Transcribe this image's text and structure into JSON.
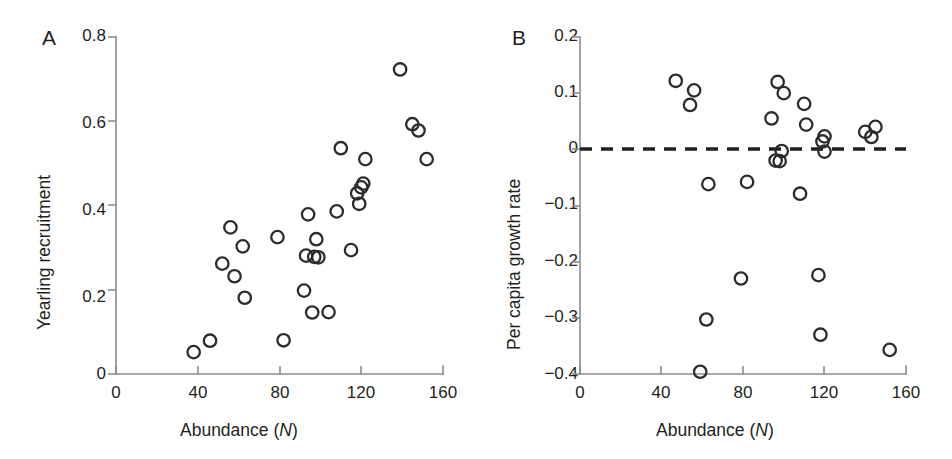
{
  "figure": {
    "background": "#ffffff",
    "marker_color": "#2b2b2b",
    "axis_color": "#8c8c8c",
    "text_color": "#231f20"
  },
  "panels": [
    {
      "label": "A",
      "xlabel_main": "Abundance (",
      "xlabel_italic": "N",
      "xlabel_tail": ")",
      "ylabel": "Yearling recruitment",
      "x_ticks": [
        "0",
        "40",
        "80",
        "120",
        "160"
      ],
      "y_ticks": [
        "0.8",
        "0.6",
        "0.4",
        "0.2",
        "0"
      ]
    },
    {
      "label": "B",
      "xlabel_main": "Abundance (",
      "xlabel_italic": "N",
      "xlabel_tail": ")",
      "ylabel": "Per capita growth rate",
      "x_ticks": [
        "0",
        "40",
        "80",
        "120",
        "160"
      ],
      "y_ticks": [
        "0.2",
        "0.1",
        "0",
        "−0.1",
        "−0.2",
        "−0.3",
        "−0.4"
      ]
    }
  ],
  "chart_data": [
    {
      "type": "scatter",
      "panel": "A",
      "title": "",
      "xlabel": "Abundance (N)",
      "ylabel": "Yearling recruitment",
      "xlim": [
        0,
        160
      ],
      "ylim": [
        0,
        0.8
      ],
      "xticks": [
        0,
        40,
        80,
        120,
        160
      ],
      "yticks": [
        0,
        0.2,
        0.4,
        0.6,
        0.8
      ],
      "grid": false,
      "legend": "none",
      "marker": "open-circle",
      "points": [
        {
          "x": 38,
          "y": 0.052
        },
        {
          "x": 46,
          "y": 0.079
        },
        {
          "x": 52,
          "y": 0.262
        },
        {
          "x": 56,
          "y": 0.348
        },
        {
          "x": 58,
          "y": 0.232
        },
        {
          "x": 62,
          "y": 0.303
        },
        {
          "x": 63,
          "y": 0.181
        },
        {
          "x": 79,
          "y": 0.325
        },
        {
          "x": 82,
          "y": 0.08
        },
        {
          "x": 92,
          "y": 0.198
        },
        {
          "x": 93,
          "y": 0.281
        },
        {
          "x": 94,
          "y": 0.379
        },
        {
          "x": 96,
          "y": 0.146
        },
        {
          "x": 97,
          "y": 0.278
        },
        {
          "x": 98,
          "y": 0.32
        },
        {
          "x": 99,
          "y": 0.277
        },
        {
          "x": 104,
          "y": 0.147
        },
        {
          "x": 108,
          "y": 0.386
        },
        {
          "x": 110,
          "y": 0.536
        },
        {
          "x": 115,
          "y": 0.294
        },
        {
          "x": 118,
          "y": 0.429
        },
        {
          "x": 119,
          "y": 0.404
        },
        {
          "x": 120,
          "y": 0.443
        },
        {
          "x": 121,
          "y": 0.452
        },
        {
          "x": 122,
          "y": 0.51
        },
        {
          "x": 139,
          "y": 0.723
        },
        {
          "x": 145,
          "y": 0.593
        },
        {
          "x": 148,
          "y": 0.578
        },
        {
          "x": 152,
          "y": 0.51
        }
      ]
    },
    {
      "type": "scatter",
      "panel": "B",
      "title": "",
      "xlabel": "Abundance (N)",
      "ylabel": "Per capita growth rate",
      "xlim": [
        0,
        160
      ],
      "ylim": [
        -0.4,
        0.2
      ],
      "xticks": [
        0,
        40,
        80,
        120,
        160
      ],
      "yticks": [
        -0.4,
        -0.3,
        -0.2,
        -0.1,
        0,
        0.1,
        0.2
      ],
      "grid": false,
      "legend": "none",
      "marker": "open-circle",
      "reference_line": {
        "type": "hline",
        "y": 0,
        "style": "dashed"
      },
      "points": [
        {
          "x": 47,
          "y": 0.122
        },
        {
          "x": 54,
          "y": 0.079
        },
        {
          "x": 56,
          "y": 0.105
        },
        {
          "x": 59,
          "y": -0.396
        },
        {
          "x": 62,
          "y": -0.303
        },
        {
          "x": 63,
          "y": -0.062
        },
        {
          "x": 79,
          "y": -0.23
        },
        {
          "x": 82,
          "y": -0.058
        },
        {
          "x": 94,
          "y": 0.055
        },
        {
          "x": 96,
          "y": -0.02
        },
        {
          "x": 97,
          "y": 0.12
        },
        {
          "x": 98,
          "y": -0.021
        },
        {
          "x": 99,
          "y": -0.003
        },
        {
          "x": 100,
          "y": 0.1
        },
        {
          "x": 108,
          "y": -0.079
        },
        {
          "x": 110,
          "y": 0.081
        },
        {
          "x": 111,
          "y": 0.044
        },
        {
          "x": 117,
          "y": -0.224
        },
        {
          "x": 118,
          "y": -0.33
        },
        {
          "x": 119,
          "y": 0.014
        },
        {
          "x": 120,
          "y": 0.023
        },
        {
          "x": 120,
          "y": -0.004
        },
        {
          "x": 140,
          "y": 0.031
        },
        {
          "x": 143,
          "y": 0.022
        },
        {
          "x": 145,
          "y": 0.04
        },
        {
          "x": 152,
          "y": -0.357
        }
      ]
    }
  ]
}
